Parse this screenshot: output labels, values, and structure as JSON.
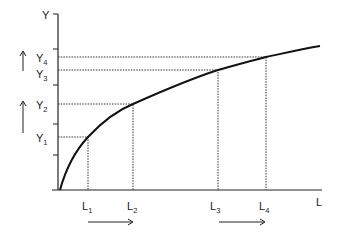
{
  "diagram": {
    "type": "production-function",
    "y_axis_label": "Y",
    "x_axis_label": "L",
    "y_levels": [
      {
        "base": "Y",
        "sub": "1",
        "y": 137
      },
      {
        "base": "Y",
        "sub": "2",
        "y": 104
      },
      {
        "base": "Y",
        "sub": "3",
        "y": 70
      },
      {
        "base": "Y",
        "sub": "4",
        "y": 57
      }
    ],
    "l_levels": [
      {
        "base": "L",
        "sub": "1",
        "x": 88
      },
      {
        "base": "L",
        "sub": "2",
        "x": 133
      },
      {
        "base": "L",
        "sub": "3",
        "x": 218
      },
      {
        "base": "L",
        "sub": "4",
        "x": 266
      }
    ],
    "arrows": {
      "vertical_left": [
        "Y1 to Y2 (up)",
        "Y3 to Y4 (up)"
      ],
      "horizontal_bottom": [
        "L1 to L2 (right)",
        "L3 to L4 (right)"
      ]
    },
    "colors": {
      "line": "#222222",
      "background": "#ffffff"
    }
  }
}
